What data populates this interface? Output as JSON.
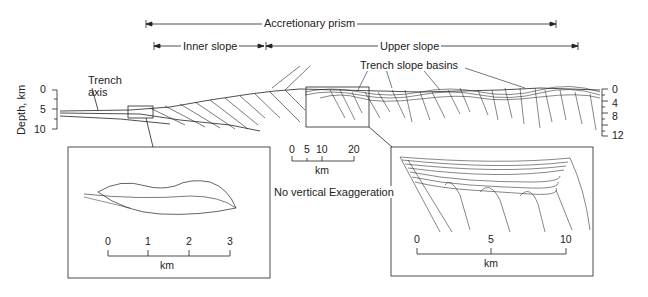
{
  "labels": {
    "accretionary_prism": "Accretionary prism",
    "inner_slope": "Inner slope",
    "upper_slope": "Upper slope",
    "trench_slope_basins": "Trench slope basins",
    "trench_axis_line1": "Trench",
    "trench_axis_line2": "axis",
    "depth_axis": "Depth, km",
    "no_vertical_exaggeration": "No vertical Exaggeration"
  },
  "left_depth_axis": {
    "ticks": [
      "0",
      "5",
      "10"
    ]
  },
  "right_depth_axis": {
    "ticks": [
      "0",
      "4",
      "8",
      "12"
    ]
  },
  "main_scale": {
    "ticks": [
      "0",
      "5",
      "10",
      "20"
    ],
    "unit": "km"
  },
  "inset_left_scale": {
    "ticks": [
      "0",
      "1",
      "2",
      "3"
    ],
    "unit": "km"
  },
  "inset_right_scale": {
    "ticks": [
      "0",
      "5",
      "10"
    ],
    "unit": "km"
  },
  "colors": {
    "line": "#222222",
    "background": "#ffffff"
  }
}
